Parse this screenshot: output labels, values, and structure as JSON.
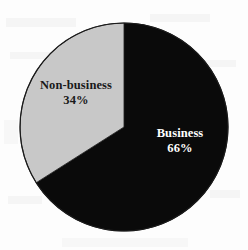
{
  "chart_data": {
    "type": "pie",
    "title": "",
    "subtitle": "",
    "xlabel": "",
    "ylabel": "",
    "legend_position": "none",
    "grid": false,
    "categories": [
      "Business",
      "Non-business"
    ],
    "values": [
      66,
      34
    ],
    "units": "%",
    "start_angle_deg": 0,
    "direction": "clockwise",
    "slices": [
      {
        "label": "Business",
        "value": 66,
        "percent_text": "66%",
        "color": "#0a0a0a",
        "label_color": "#ffffff",
        "start_angle_deg": 0,
        "end_angle_deg": 237.6
      },
      {
        "label": "Non-business",
        "value": 34,
        "percent_text": "34%",
        "color": "#c8c8c8",
        "label_color": "#1a1a1a",
        "start_angle_deg": 237.6,
        "end_angle_deg": 360
      }
    ],
    "annotations": []
  },
  "figure": {
    "background_color": "#fdfdfd",
    "outline_color": "#1a1a1a",
    "center_x": 124,
    "center_y": 127,
    "radius": 104
  }
}
